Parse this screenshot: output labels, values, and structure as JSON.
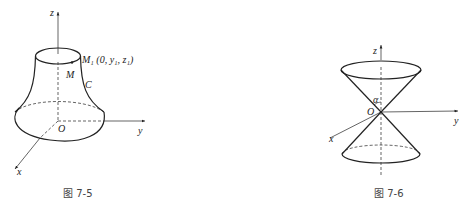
{
  "figures": [
    {
      "id": "fig-7-5",
      "caption": "图 7-5",
      "labels": {
        "z": "z",
        "y": "y",
        "x": "x",
        "origin": "O",
        "point_m1": "M₁ (0, y₁, z₁)",
        "point_m": "M",
        "curve_c": "C"
      }
    },
    {
      "id": "fig-7-6",
      "caption": "图 7-6",
      "labels": {
        "z": "z",
        "y": "y",
        "x": "x",
        "origin": "O",
        "angle": "α"
      }
    }
  ],
  "colors": {
    "line": "#222222",
    "caption": "#444444"
  }
}
